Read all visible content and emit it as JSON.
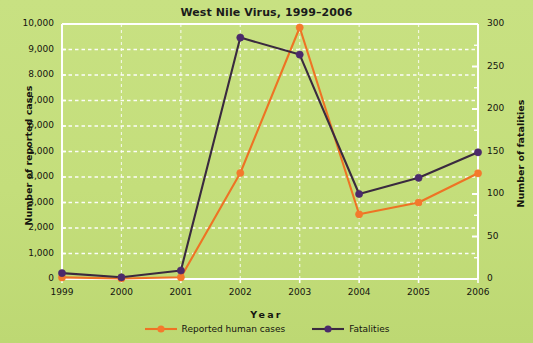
{
  "chart_data": {
    "type": "line",
    "title": "West Nile Virus, 1999–2006",
    "xlabel": "Year",
    "categories": [
      "1999",
      "2000",
      "2001",
      "2002",
      "2003",
      "2004",
      "2005",
      "2006"
    ],
    "grid": true,
    "legend_position": "bottom",
    "axes": {
      "left": {
        "label": "Number of reported cases",
        "min": 0,
        "max": 10000,
        "step": 1000,
        "ticks": [
          "0",
          "1,000",
          "2,000",
          "3,000",
          "4,000",
          "5,000",
          "6,000",
          "7,000",
          "8.000",
          "9,000",
          "10,000"
        ]
      },
      "right": {
        "label": "Number of fatalities",
        "min": 0,
        "max": 300,
        "step": 50,
        "minor_step": 25,
        "ticks": [
          "0",
          "50",
          "100",
          "150",
          "200",
          "250",
          "300"
        ]
      }
    },
    "series": [
      {
        "name": "Reported human cases",
        "axis": "left",
        "color": "#ee7324",
        "marker_color": "#f4792c",
        "values": [
          62,
          21,
          66,
          4156,
          9862,
          2539,
          3000,
          4146
        ]
      },
      {
        "name": "Fatalities",
        "axis": "right",
        "color": "#3a2a3f",
        "marker_color": "#4b2a6b",
        "values": [
          7,
          2,
          10,
          284,
          264,
          100,
          119,
          149
        ]
      }
    ]
  }
}
